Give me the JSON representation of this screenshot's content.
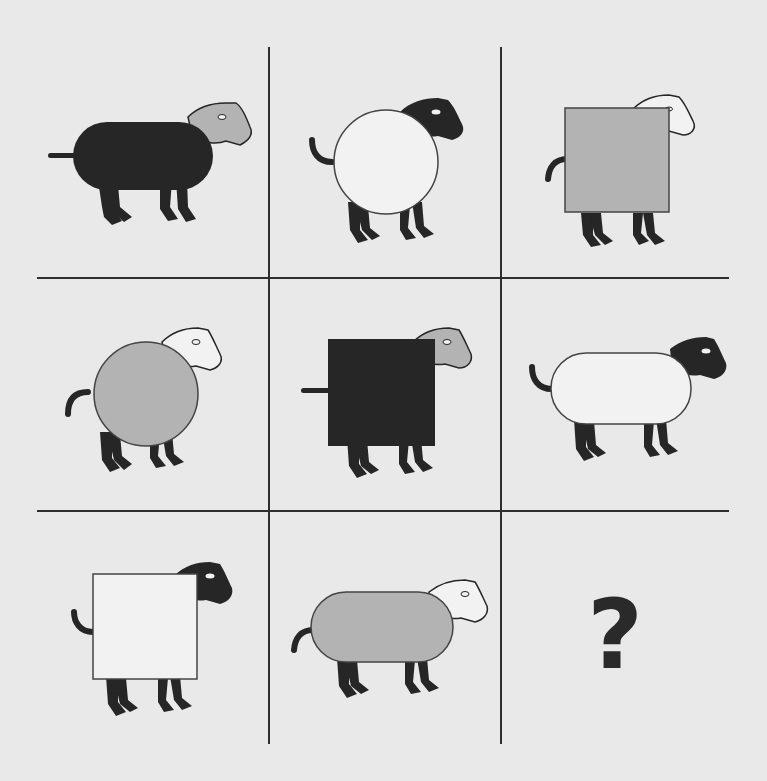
{
  "puzzle": {
    "type": "3x3 matrix reasoning",
    "colors": {
      "black": "#262626",
      "grey": "#b3b3b3",
      "white": "#f2f2f2",
      "background": "#e9e9e9",
      "line": "#2e2e2e"
    },
    "cells": [
      {
        "row": 1,
        "col": 1,
        "body_shape": "pill",
        "body_color": "black",
        "head_color": "grey",
        "tail": "straight"
      },
      {
        "row": 1,
        "col": 2,
        "body_shape": "circle",
        "body_color": "white",
        "head_color": "black",
        "tail": "curled"
      },
      {
        "row": 1,
        "col": 3,
        "body_shape": "square",
        "body_color": "grey",
        "head_color": "white",
        "tail": "curled"
      },
      {
        "row": 2,
        "col": 1,
        "body_shape": "circle",
        "body_color": "grey",
        "head_color": "white",
        "tail": "curled"
      },
      {
        "row": 2,
        "col": 2,
        "body_shape": "square",
        "body_color": "black",
        "head_color": "grey",
        "tail": "straight"
      },
      {
        "row": 2,
        "col": 3,
        "body_shape": "pill",
        "body_color": "white",
        "head_color": "black",
        "tail": "curled"
      },
      {
        "row": 3,
        "col": 1,
        "body_shape": "square",
        "body_color": "white",
        "head_color": "black",
        "tail": "curled"
      },
      {
        "row": 3,
        "col": 2,
        "body_shape": "pill",
        "body_color": "grey",
        "head_color": "white",
        "tail": "curled"
      },
      {
        "row": 3,
        "col": 3,
        "missing": true,
        "label": "?"
      }
    ]
  }
}
